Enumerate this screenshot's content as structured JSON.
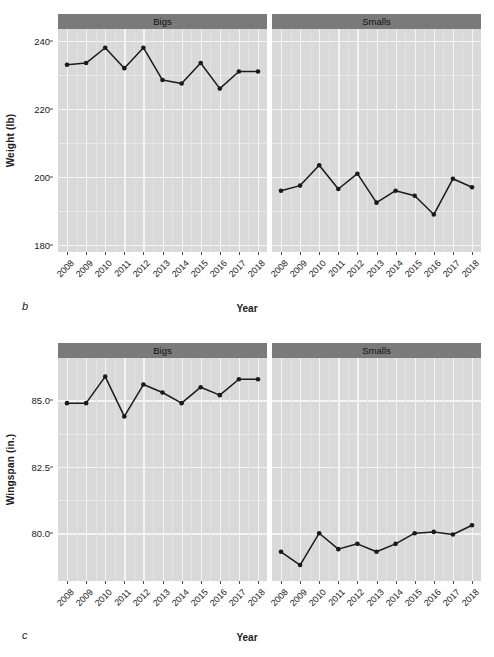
{
  "figure": {
    "panels": [
      {
        "letter": "b",
        "ylabel": "Weight (lb)",
        "xlabel": "Year",
        "facets": [
          "Bigs",
          "Smalls"
        ],
        "yticks": [
          "240",
          "220",
          "200",
          "180"
        ],
        "xticks": [
          "2008",
          "2009",
          "2010",
          "2011",
          "2012",
          "2013",
          "2014",
          "2015",
          "2016",
          "2017",
          "2018"
        ]
      },
      {
        "letter": "c",
        "ylabel": "Wingspan (in.)",
        "xlabel": "Year",
        "facets": [
          "Bigs",
          "Smalls"
        ],
        "yticks": [
          "85.0",
          "82.5",
          "80.0"
        ],
        "xticks": [
          "2008",
          "2009",
          "2010",
          "2011",
          "2012",
          "2013",
          "2014",
          "2015",
          "2016",
          "2017",
          "2018"
        ]
      }
    ]
  },
  "colors": {
    "panel_background": "#d9d9d9",
    "strip_background": "#7a7a7a",
    "gridline": "#f4f4f4",
    "line": "#1a1a1a",
    "point": "#1a1a1a",
    "text": "#1a1a1a"
  },
  "chart_data": [
    {
      "type": "line",
      "panel_letter": "b",
      "title": "",
      "xlabel": "Year",
      "ylabel": "Weight (lb)",
      "x": [
        2008,
        2009,
        2010,
        2011,
        2012,
        2013,
        2014,
        2015,
        2016,
        2017,
        2018
      ],
      "ylim": [
        178,
        243.5
      ],
      "ytick_values": [
        240,
        220,
        200,
        180
      ],
      "grid": true,
      "legend_position": "none",
      "facet_variable": "group",
      "series": [
        {
          "name": "Bigs",
          "facet": "Bigs",
          "values": [
            233.0,
            233.5,
            238.0,
            232.0,
            238.0,
            228.5,
            227.5,
            233.5,
            226.0,
            231.0,
            231.0
          ]
        },
        {
          "name": "Smalls",
          "facet": "Smalls",
          "values": [
            196.0,
            197.5,
            203.5,
            196.5,
            201.0,
            192.5,
            196.0,
            194.5,
            189.0,
            199.5,
            197.0
          ]
        }
      ]
    },
    {
      "type": "line",
      "panel_letter": "c",
      "title": "",
      "xlabel": "Year",
      "ylabel": "Wingspan (in.)",
      "x": [
        2008,
        2009,
        2010,
        2011,
        2012,
        2013,
        2014,
        2015,
        2016,
        2017,
        2018
      ],
      "ylim": [
        78.2,
        86.6
      ],
      "ytick_values": [
        85.0,
        82.5,
        80.0
      ],
      "grid": true,
      "legend_position": "none",
      "facet_variable": "group",
      "series": [
        {
          "name": "Bigs",
          "facet": "Bigs",
          "values": [
            84.9,
            84.9,
            85.9,
            84.4,
            85.6,
            85.3,
            84.9,
            85.5,
            85.2,
            85.8,
            85.8
          ]
        },
        {
          "name": "Smalls",
          "facet": "Smalls",
          "values": [
            79.3,
            78.8,
            80.0,
            79.4,
            79.6,
            79.3,
            79.6,
            80.0,
            80.05,
            79.95,
            80.3
          ]
        }
      ]
    }
  ]
}
